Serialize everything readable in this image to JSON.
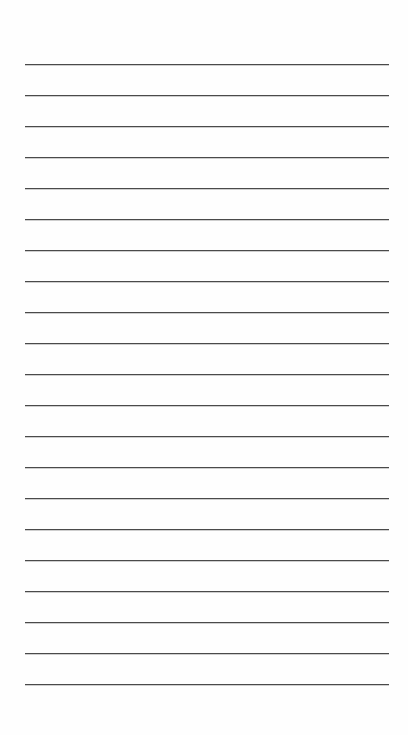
{
  "page": {
    "type": "lined-paper",
    "background_color": "#fefefe",
    "line_color": "#4a4a4a",
    "line_count": 21,
    "first_line_y": 64,
    "line_spacing": 31,
    "line_left": 25,
    "line_right": 389,
    "lines": [
      {
        "text": ""
      },
      {
        "text": ""
      },
      {
        "text": ""
      },
      {
        "text": ""
      },
      {
        "text": ""
      },
      {
        "text": ""
      },
      {
        "text": ""
      },
      {
        "text": ""
      },
      {
        "text": ""
      },
      {
        "text": ""
      },
      {
        "text": ""
      },
      {
        "text": ""
      },
      {
        "text": ""
      },
      {
        "text": ""
      },
      {
        "text": ""
      },
      {
        "text": ""
      },
      {
        "text": ""
      },
      {
        "text": ""
      },
      {
        "text": ""
      },
      {
        "text": ""
      },
      {
        "text": ""
      }
    ]
  }
}
